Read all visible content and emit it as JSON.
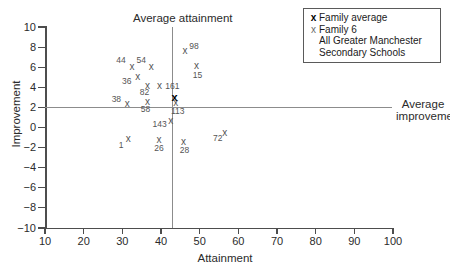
{
  "chart_data": {
    "type": "scatter",
    "title": "",
    "xlabel": "Attainment",
    "ylabel": "Improvement",
    "xlim": [
      10,
      100
    ],
    "ylim": [
      -10,
      10
    ],
    "xticks": [
      10,
      20,
      30,
      40,
      50,
      60,
      70,
      80,
      90,
      100
    ],
    "yticks": [
      10,
      8,
      6,
      4,
      2,
      0,
      -2,
      -4,
      -6,
      -8,
      -10
    ],
    "grid": false,
    "legend_position": "top-right",
    "reference_lines": {
      "average_attainment": 45,
      "average_improvement": 2.4,
      "vertical_label": "Average attainment",
      "horizontal_label": "Average improvement"
    },
    "series": [
      {
        "name": "Family 6",
        "marker": "x",
        "points": [
          {
            "label": "44",
            "x": 32.5,
            "y": 6.0
          },
          {
            "label": "54",
            "x": 37.5,
            "y": 6.0
          },
          {
            "label": "36",
            "x": 34.0,
            "y": 5.0
          },
          {
            "label": "82",
            "x": 36.5,
            "y": 4.1
          },
          {
            "label": "161",
            "x": 39.6,
            "y": 4.1
          },
          {
            "label": "98",
            "x": 46.2,
            "y": 7.6
          },
          {
            "label": "15",
            "x": 49.2,
            "y": 6.1
          },
          {
            "label": "38",
            "x": 31.3,
            "y": 2.3
          },
          {
            "label": "58",
            "x": 36.5,
            "y": 2.5
          },
          {
            "label": "113",
            "x": 43.8,
            "y": 2.4
          },
          {
            "label": "143",
            "x": 42.5,
            "y": 0.6
          },
          {
            "label": "1",
            "x": 31.5,
            "y": -1.1
          },
          {
            "label": "26",
            "x": 39.5,
            "y": -1.2
          },
          {
            "label": "28",
            "x": 45.8,
            "y": -1.4
          },
          {
            "label": "72",
            "x": 56.5,
            "y": -0.5
          }
        ]
      },
      {
        "name": "Family average",
        "marker": "X-bold",
        "points": [
          {
            "label": "",
            "x": 43.5,
            "y": 3.0
          }
        ]
      }
    ]
  },
  "legend": {
    "rows": [
      {
        "key": "x",
        "key_style": "bold",
        "text": "Family average"
      },
      {
        "key": "x",
        "key_style": "thin",
        "text": "Family 6"
      },
      {
        "key": "",
        "key_style": "none",
        "text": "All Greater Manchester"
      },
      {
        "key": "",
        "key_style": "none",
        "text": "Secondary Schools"
      }
    ]
  },
  "axes": {
    "x_label": "Attainment",
    "y_label": "Improvement",
    "x_tick_labels": [
      "10",
      "20",
      "30",
      "40",
      "50",
      "60",
      "70",
      "80",
      "90",
      "100"
    ],
    "y_tick_labels": [
      "10",
      "8",
      "6",
      "4",
      "2",
      "0",
      "-2",
      "-4",
      "-6",
      "-8",
      "-10"
    ]
  },
  "annotations": {
    "vertical": "Average attainment",
    "horizontal_line1": "Average",
    "horizontal_line2": "improvement"
  }
}
